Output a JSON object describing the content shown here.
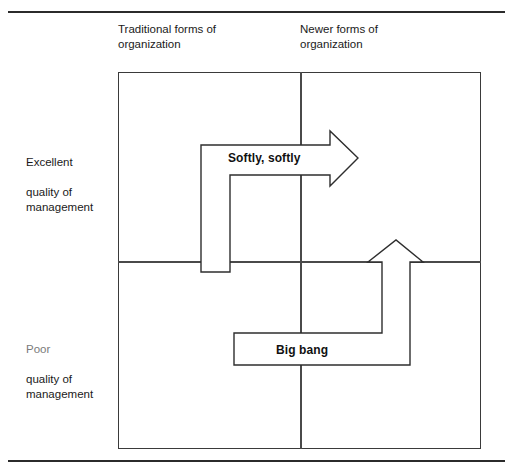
{
  "figure": {
    "columns": [
      {
        "id": "traditional",
        "label": "Traditional forms of\norganization"
      },
      {
        "id": "newer",
        "label": "Newer forms of\norganization"
      }
    ],
    "rows": [
      {
        "id": "excellent",
        "label_line1": "Excellent",
        "label_rest": "quality of\nmanagement"
      },
      {
        "id": "poor",
        "label_line1": "Poor",
        "label_rest": "quality of\nmanagement"
      }
    ],
    "arrows": [
      {
        "id": "softly-softly",
        "label": "Softly, softly",
        "direction": "up-then-right",
        "from_quadrant": "traditional/poor",
        "to_quadrant": "newer/excellent"
      },
      {
        "id": "big-bang",
        "label": "Big bang",
        "direction": "right-then-up",
        "from_quadrant": "traditional/poor",
        "to_quadrant": "newer/excellent"
      }
    ],
    "colors": {
      "rule": "#2b2b2b",
      "box_border": "#3a3a3a",
      "divider": "#4a4a4a",
      "arrow_stroke": "#2e2e2e",
      "arrow_fill": "#ffffff",
      "text": "#1a1a1a"
    }
  }
}
